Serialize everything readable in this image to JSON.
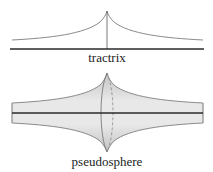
{
  "figure": {
    "top_panel": {
      "label": "tractrix"
    },
    "bottom_panel": {
      "label": "pseudosphere"
    }
  },
  "colors": {
    "curve": "#8a8a8a",
    "axis": "#2a2a2a",
    "surface_light": "#e6e6e6",
    "surface_dark": "#bdbdbd",
    "text": "#222222"
  }
}
